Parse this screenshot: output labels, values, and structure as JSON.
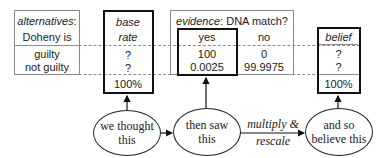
{
  "alternatives": {
    "header_italic": "alternatives",
    "header_suffix": ":",
    "header_line2": "Doheny is",
    "rows": [
      "guilty",
      "not guilty"
    ]
  },
  "base_rate": {
    "header_line1": "base",
    "header_line2": "rate",
    "values": [
      "?",
      "?"
    ],
    "total": "100%"
  },
  "evidence": {
    "header_italic": "evidence",
    "header_rest": ": DNA match?",
    "columns": [
      {
        "label": "yes",
        "values": [
          "100",
          "0.0025"
        ]
      },
      {
        "label": "no",
        "values": [
          "0",
          "99.9975"
        ]
      }
    ]
  },
  "belief": {
    "header": "belief",
    "values": [
      "?",
      "?"
    ],
    "total": "100%"
  },
  "flow": {
    "nodes": [
      {
        "line1": "we thought",
        "line2": "this"
      },
      {
        "line1": "then saw",
        "line2": "this"
      },
      {
        "line1": "and so",
        "line2": "believe this"
      }
    ],
    "edge_label": {
      "line1_italic": "multiply",
      "line1_rest": " &",
      "line2": "rescale"
    }
  }
}
